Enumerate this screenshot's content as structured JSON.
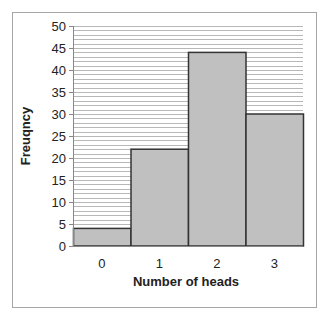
{
  "chart_data": {
    "type": "bar",
    "title": "",
    "categories": [
      "0",
      "1",
      "2",
      "3"
    ],
    "values": [
      4,
      22,
      44,
      30
    ],
    "xlabel": "Number of heads",
    "ylabel": "Freuqncy",
    "ylim": [
      0,
      50
    ],
    "yticks": [
      0,
      5,
      10,
      15,
      20,
      25,
      30,
      35,
      40,
      45,
      50
    ],
    "grid": true,
    "grid_step": 1,
    "legend": null,
    "bar_color": "#c0c0c0",
    "bar_edge_color": "#333333"
  }
}
